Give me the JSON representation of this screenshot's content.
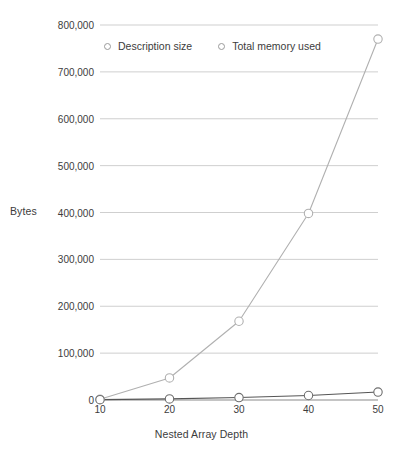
{
  "chart_data": {
    "type": "line",
    "title": "",
    "xlabel": "Nested Array Depth",
    "ylabel": "Bytes",
    "x": [
      10,
      20,
      30,
      40,
      50
    ],
    "xtick_labels": [
      "10",
      "20",
      "30",
      "40",
      "50"
    ],
    "ytick_labels": [
      "0",
      "100,000",
      "200,000",
      "300,000",
      "400,000",
      "500,000",
      "600,000",
      "700,000",
      "800,000"
    ],
    "ytick_values": [
      0,
      100000,
      200000,
      300000,
      400000,
      500000,
      600000,
      700000,
      800000
    ],
    "ylim": [
      0,
      800000
    ],
    "xlim": [
      10,
      50
    ],
    "grid": "horizontal",
    "legend_position": "top-center",
    "series": [
      {
        "name": "Description size",
        "values": [
          800,
          2400,
          5200,
          9600,
          17000
        ],
        "color": "#555555",
        "marker": "open-circle"
      },
      {
        "name": "Total memory used",
        "values": [
          1600,
          47000,
          168000,
          398000,
          770000
        ],
        "color": "#b0b0b0",
        "marker": "open-circle"
      }
    ]
  },
  "legend": {
    "items": [
      {
        "label": "Description size"
      },
      {
        "label": "Total memory used"
      }
    ]
  },
  "axes": {
    "y_title": "Bytes",
    "x_title": "Nested Array Depth"
  },
  "colors": {
    "grid": "#c9c9c9",
    "axis_text": "#3c3c3c",
    "series_description": "#555555",
    "series_memory": "#b0b0b0",
    "marker_fill": "#ffffff",
    "background": "#ffffff"
  }
}
